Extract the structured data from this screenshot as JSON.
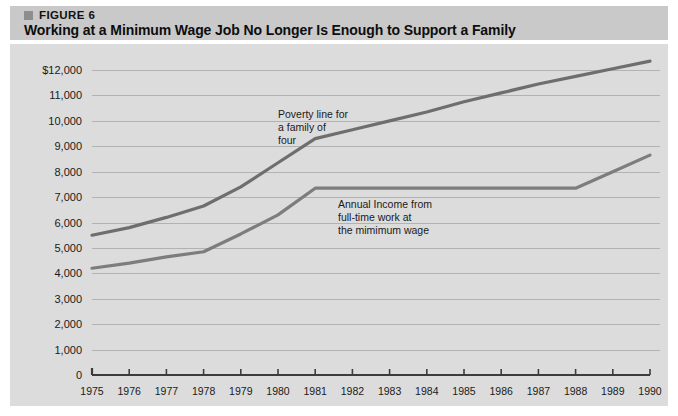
{
  "figure": {
    "label": "FIGURE 6",
    "title": "Working at a Minimum Wage Job No Longer Is Enough to Support a Family",
    "bullet_icon": "square-bullet-icon"
  },
  "colors": {
    "header_band": "#c9c9c9",
    "panel_background": "#dcdcdc",
    "grid_line": "#b2b2b2",
    "axis": "#3c3c3c",
    "poverty_line": "#6e6e6e",
    "minimum_wage_line": "#7d7d7d",
    "text": "#1a1a1a"
  },
  "chart_data": {
    "type": "line",
    "title": "Working at a Minimum Wage Job No Longer Is Enough to Support a Family",
    "xlabel": "",
    "ylabel": "",
    "grid": true,
    "legend_position": "inline-annotations",
    "xlim": [
      1975,
      1990
    ],
    "ylim": [
      0,
      12000
    ],
    "x": [
      1975,
      1976,
      1977,
      1978,
      1979,
      1980,
      1981,
      1982,
      1983,
      1984,
      1985,
      1986,
      1987,
      1988,
      1989,
      1990
    ],
    "xtick_labels": [
      "1975",
      "1976",
      "1977",
      "1978",
      "1979",
      "1980",
      "1981",
      "1982",
      "1983",
      "1984",
      "1985",
      "1986",
      "1987",
      "1988",
      "1989",
      "1990"
    ],
    "ytick_values": [
      0,
      1000,
      2000,
      3000,
      4000,
      5000,
      6000,
      7000,
      8000,
      9000,
      10000,
      11000,
      12000
    ],
    "ytick_labels": [
      "0",
      "1,000",
      "2,000",
      "3,000",
      "4,000",
      "5,000",
      "6,000",
      "7,000",
      "8,000",
      "9,000",
      "10,000",
      "11,000",
      "$12,000"
    ],
    "series": [
      {
        "name": "Poverty line for a family of four",
        "color": "#6e6e6e",
        "values": [
          5500,
          5800,
          6200,
          6650,
          7400,
          8350,
          9300,
          9650,
          10000,
          10350,
          10750,
          11100,
          11450,
          11750,
          12050,
          12350
        ]
      },
      {
        "name": "Annual Income from full-time work at the mimimum wage",
        "color": "#7d7d7d",
        "values": [
          4200,
          4400,
          4650,
          4850,
          5550,
          6300,
          7350,
          7350,
          7350,
          7350,
          7350,
          7350,
          7350,
          7350,
          8000,
          8650
        ]
      }
    ],
    "annotations": [
      {
        "name": "poverty-line-annotation",
        "text": "Poverty line for\na family of\nfour",
        "x_px": 278,
        "y_px": 108
      },
      {
        "name": "minimum-wage-annotation",
        "text": "Annual Income from\nfull-time work at\nthe mimimum wage",
        "x_px": 338,
        "y_px": 198
      }
    ]
  }
}
